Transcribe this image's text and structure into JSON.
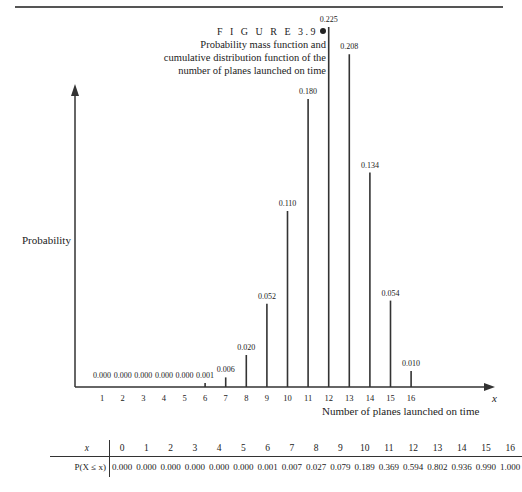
{
  "figure": {
    "label": "F I G U R E 3.9",
    "caption_lines": [
      "Probability mass function and",
      "cumulative distribution function of the",
      "number of planes launched on time"
    ]
  },
  "chart_data": {
    "type": "bar",
    "xlabel": "Number of planes launched on time",
    "ylabel": "Probability",
    "x_axis_symbol": "x",
    "categories": [
      1,
      2,
      3,
      4,
      5,
      6,
      7,
      8,
      9,
      10,
      11,
      12,
      13,
      14,
      15,
      16
    ],
    "values": [
      0.0,
      0.0,
      0.0,
      0.0,
      0.0,
      0.001,
      0.006,
      0.02,
      0.052,
      0.11,
      0.18,
      0.225,
      0.208,
      0.134,
      0.054,
      0.01
    ],
    "value_labels": [
      "0.000",
      "0.000",
      "0.000",
      "0.000",
      "0.000",
      "0.001",
      "0.006",
      "0.020",
      "0.052",
      "0.110",
      "0.180",
      "0.225",
      "0.208",
      "0.134",
      "0.054",
      "0.010"
    ],
    "ylim": [
      0,
      0.24
    ],
    "grid": false,
    "legend": null
  },
  "cdf_table": {
    "x_label": "x",
    "p_label": "P(X ≤ x)",
    "x": [
      "0",
      "1",
      "2",
      "3",
      "4",
      "5",
      "6",
      "7",
      "8",
      "9",
      "10",
      "11",
      "12",
      "13",
      "14",
      "15",
      "16"
    ],
    "p": [
      "0.000",
      "0.000",
      "0.000",
      "0.000",
      "0.000",
      "0.000",
      "0.001",
      "0.007",
      "0.027",
      "0.079",
      "0.189",
      "0.369",
      "0.594",
      "0.802",
      "0.936",
      "0.990",
      "1.000"
    ]
  }
}
